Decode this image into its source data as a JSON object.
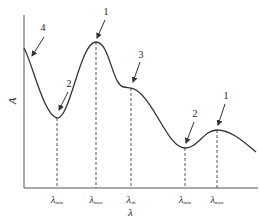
{
  "diagram": {
    "type": "absorption-spectrum-schematic",
    "axes": {
      "x_label": "λ",
      "y_label": "A"
    },
    "ticks": [
      {
        "symbol": "λ",
        "sub": "min",
        "x": 57
      },
      {
        "symbol": "λ",
        "sub": "max",
        "x": 96
      },
      {
        "symbol": "λ",
        "sub": "sh",
        "x": 131
      },
      {
        "symbol": "λ",
        "sub": "min",
        "x": 185
      },
      {
        "symbol": "λ",
        "sub": "max",
        "x": 217
      }
    ],
    "annotations": [
      {
        "label": "4",
        "meaning": "end absorption"
      },
      {
        "label": "2",
        "meaning": "absorption minimum (trough)"
      },
      {
        "label": "1",
        "meaning": "absorption maximum (peak)"
      },
      {
        "label": "3",
        "meaning": "shoulder"
      },
      {
        "label": "2",
        "meaning": "absorption minimum (trough)"
      },
      {
        "label": "1",
        "meaning": "absorption maximum (peak)"
      }
    ],
    "colors": {
      "line": "#333333",
      "background": "#ffffff"
    }
  }
}
